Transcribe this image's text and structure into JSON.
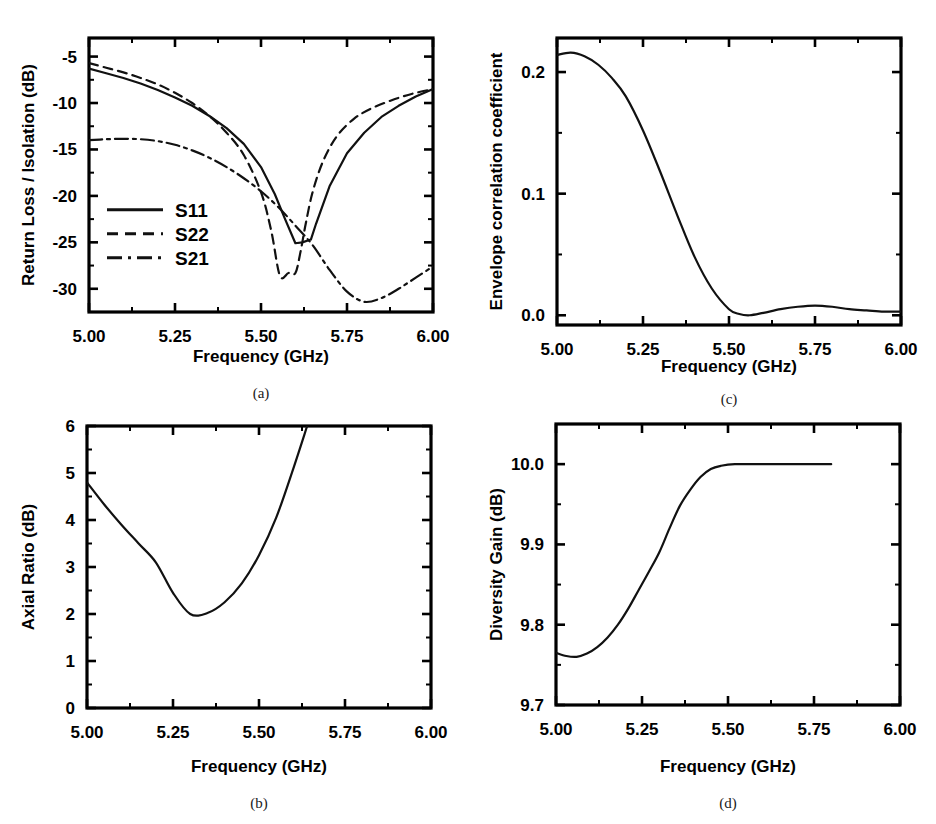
{
  "figure": {
    "width": 936,
    "height": 824,
    "background": "#ffffff",
    "line_color": "#111111"
  },
  "panels": [
    {
      "id": "a",
      "caption": "(a)",
      "xlabel": "Frequency (GHz)",
      "ylabel": "Return Loss / Isolation (dB)",
      "xticks": [
        "5.00",
        "5.25",
        "5.50",
        "5.75",
        "6.00"
      ],
      "yticks": [
        "-5",
        "-10",
        "-15",
        "-20",
        "-25",
        "-30"
      ],
      "legend": [
        "S11",
        "S22",
        "S21"
      ]
    },
    {
      "id": "b",
      "caption": "(b)",
      "xlabel": "Frequency (GHz)",
      "ylabel": "Axial Ratio (dB)",
      "xticks": [
        "5.00",
        "5.25",
        "5.50",
        "5.75",
        "6.00"
      ],
      "yticks": [
        "0",
        "1",
        "2",
        "3",
        "4",
        "5",
        "6"
      ],
      "legend": []
    },
    {
      "id": "c",
      "caption": "(c)",
      "xlabel": "Frequency (GHz)",
      "ylabel": "Envelope correlation coefficient",
      "xticks": [
        "5.00",
        "5.25",
        "5.50",
        "5.75",
        "6.00"
      ],
      "yticks": [
        "0.0",
        "0.1",
        "0.2"
      ],
      "legend": []
    },
    {
      "id": "d",
      "caption": "(d)",
      "xlabel": "Frequency (GHz)",
      "ylabel": "Diversity Gain (dB)",
      "xticks": [
        "5.00",
        "5.25",
        "5.50",
        "5.75",
        "6.00"
      ],
      "yticks": [
        "9.7",
        "9.8",
        "9.9",
        "10.0"
      ],
      "legend": []
    }
  ],
  "chart_data": [
    {
      "panel": "a",
      "type": "line",
      "title": "",
      "xlabel": "Frequency (GHz)",
      "ylabel": "Return Loss / Isolation (dB)",
      "xlim": [
        5.0,
        6.0
      ],
      "ylim": [
        -32.5,
        -3.0
      ],
      "xticks": [
        5.0,
        5.25,
        5.5,
        5.75,
        6.0
      ],
      "yticks": [
        -5,
        -10,
        -15,
        -20,
        -25,
        -30
      ],
      "grid": false,
      "legend_position": "center-left",
      "series": [
        {
          "name": "S11",
          "style": "solid",
          "x": [
            5.0,
            5.05,
            5.1,
            5.15,
            5.2,
            5.25,
            5.3,
            5.35,
            5.4,
            5.45,
            5.5,
            5.54,
            5.57,
            5.6,
            5.62,
            5.645,
            5.66,
            5.7,
            5.75,
            5.8,
            5.85,
            5.9,
            5.95,
            6.0
          ],
          "y": [
            -6.3,
            -6.8,
            -7.3,
            -7.9,
            -8.6,
            -9.4,
            -10.3,
            -11.4,
            -12.7,
            -14.4,
            -16.9,
            -19.8,
            -22.5,
            -25.1,
            -25.0,
            -24.7,
            -23.0,
            -18.9,
            -15.4,
            -13.2,
            -11.5,
            -10.3,
            -9.3,
            -8.5
          ]
        },
        {
          "name": "S22",
          "style": "dashed",
          "x": [
            5.0,
            5.05,
            5.1,
            5.15,
            5.2,
            5.25,
            5.3,
            5.35,
            5.4,
            5.45,
            5.5,
            5.53,
            5.555,
            5.58,
            5.6,
            5.615,
            5.63,
            5.65,
            5.68,
            5.72,
            5.77,
            5.82,
            5.88,
            5.94,
            6.0
          ],
          "y": [
            -5.7,
            -6.2,
            -6.7,
            -7.3,
            -8.0,
            -8.9,
            -10.0,
            -11.4,
            -13.2,
            -15.6,
            -19.6,
            -23.8,
            -28.6,
            -28.3,
            -28.3,
            -26.0,
            -23.0,
            -19.6,
            -16.3,
            -13.6,
            -11.7,
            -10.6,
            -9.7,
            -9.0,
            -8.5
          ]
        },
        {
          "name": "S21",
          "style": "dashdot",
          "x": [
            5.0,
            5.05,
            5.1,
            5.15,
            5.2,
            5.25,
            5.3,
            5.35,
            5.4,
            5.45,
            5.5,
            5.55,
            5.6,
            5.65,
            5.7,
            5.75,
            5.8,
            5.85,
            5.9,
            5.95,
            6.0
          ],
          "y": [
            -14.0,
            -13.9,
            -13.85,
            -13.9,
            -14.1,
            -14.5,
            -15.1,
            -15.9,
            -16.9,
            -18.1,
            -19.5,
            -21.2,
            -23.2,
            -25.3,
            -28.0,
            -30.3,
            -31.4,
            -31.0,
            -30.0,
            -28.8,
            -27.6
          ]
        }
      ]
    },
    {
      "panel": "b",
      "type": "line",
      "title": "",
      "xlabel": "Frequency (GHz)",
      "ylabel": "Axial Ratio (dB)",
      "xlim": [
        5.0,
        6.0
      ],
      "ylim": [
        0,
        6
      ],
      "xticks": [
        5.0,
        5.25,
        5.5,
        5.75,
        6.0
      ],
      "yticks": [
        0,
        1,
        2,
        3,
        4,
        5,
        6
      ],
      "grid": false,
      "legend_position": "none",
      "series": [
        {
          "name": "Axial Ratio",
          "style": "solid",
          "x": [
            5.0,
            5.05,
            5.1,
            5.15,
            5.2,
            5.25,
            5.3,
            5.35,
            5.4,
            5.45,
            5.5,
            5.55,
            5.6,
            5.64
          ],
          "y": [
            4.8,
            4.33,
            3.9,
            3.5,
            3.1,
            2.45,
            2.0,
            2.02,
            2.25,
            2.65,
            3.25,
            4.05,
            5.1,
            6.0
          ]
        }
      ]
    },
    {
      "panel": "c",
      "type": "line",
      "title": "",
      "xlabel": "Frequency (GHz)",
      "ylabel": "Envelope correlation coefficient",
      "xlim": [
        5.0,
        6.0
      ],
      "ylim": [
        -0.008,
        0.228
      ],
      "xticks": [
        5.0,
        5.25,
        5.5,
        5.75,
        6.0
      ],
      "yticks": [
        0.0,
        0.1,
        0.2
      ],
      "grid": false,
      "legend_position": "none",
      "series": [
        {
          "name": "ECC",
          "style": "solid",
          "x": [
            5.0,
            5.04,
            5.08,
            5.12,
            5.16,
            5.2,
            5.25,
            5.3,
            5.35,
            5.4,
            5.45,
            5.5,
            5.53,
            5.56,
            5.6,
            5.65,
            5.7,
            5.75,
            5.8,
            5.85,
            5.9,
            5.95,
            6.0
          ],
          "y": [
            0.214,
            0.216,
            0.213,
            0.206,
            0.195,
            0.18,
            0.152,
            0.118,
            0.082,
            0.048,
            0.022,
            0.005,
            0.001,
            0.0,
            0.002,
            0.005,
            0.007,
            0.008,
            0.007,
            0.005,
            0.004,
            0.003,
            0.003
          ]
        }
      ]
    },
    {
      "panel": "d",
      "type": "line",
      "title": "",
      "xlabel": "Frequency (GHz)",
      "ylabel": "Diversity Gain (dB)",
      "xlim": [
        5.0,
        6.0
      ],
      "ylim": [
        9.7,
        10.05
      ],
      "xticks": [
        5.0,
        5.25,
        5.5,
        5.75,
        6.0
      ],
      "yticks": [
        9.7,
        9.8,
        9.9,
        10.0
      ],
      "grid": false,
      "legend_position": "none",
      "series": [
        {
          "name": "Diversity Gain",
          "style": "solid",
          "x": [
            5.0,
            5.03,
            5.06,
            5.09,
            5.12,
            5.15,
            5.18,
            5.21,
            5.24,
            5.27,
            5.3,
            5.33,
            5.36,
            5.39,
            5.42,
            5.45,
            5.48,
            5.52,
            5.6,
            5.7,
            5.8,
            5.9,
            6.0
          ],
          "y": [
            9.765,
            9.761,
            9.76,
            9.764,
            9.772,
            9.784,
            9.8,
            9.82,
            9.843,
            9.866,
            9.89,
            9.92,
            9.948,
            9.968,
            9.984,
            9.994,
            9.998,
            10.0,
            10.0,
            10.0,
            10.0,
            10.0
          ]
        }
      ]
    }
  ]
}
